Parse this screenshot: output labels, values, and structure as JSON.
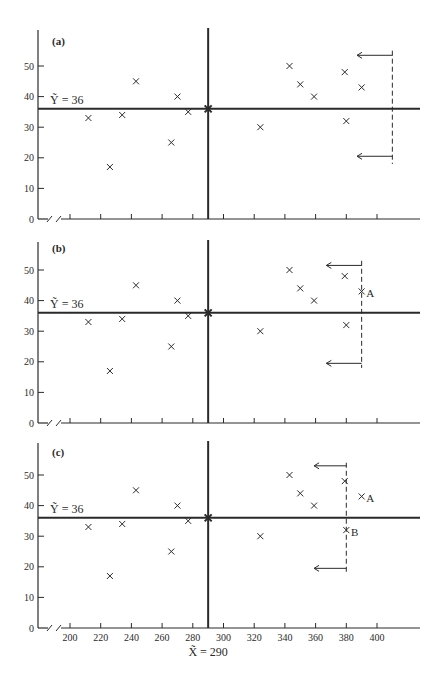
{
  "figure": {
    "ink_color": "#2a2a2a",
    "background": "#ffffff"
  },
  "chart_data": [
    {
      "type": "scatter",
      "panel_label": "(a)",
      "title": "",
      "xlabel": "",
      "ylabel": "",
      "xlim": [
        200,
        420
      ],
      "ylim": [
        0,
        58
      ],
      "yticks": [
        0,
        10,
        20,
        30,
        40,
        50
      ],
      "xticks": [
        200,
        220,
        240,
        260,
        280,
        300,
        320,
        340,
        360,
        380,
        400
      ],
      "show_xtick_labels": false,
      "axis_break": true,
      "grid": false,
      "median_x": 290,
      "median_y": 36,
      "median_y_label": "Ỹ = 36",
      "points": [
        {
          "x": 212,
          "y": 33
        },
        {
          "x": 226,
          "y": 17
        },
        {
          "x": 234,
          "y": 34
        },
        {
          "x": 243,
          "y": 45
        },
        {
          "x": 266,
          "y": 25
        },
        {
          "x": 270,
          "y": 40
        },
        {
          "x": 277,
          "y": 35
        },
        {
          "x": 290,
          "y": 36,
          "center": true
        },
        {
          "x": 324,
          "y": 30
        },
        {
          "x": 343,
          "y": 50
        },
        {
          "x": 350,
          "y": 44
        },
        {
          "x": 359,
          "y": 40
        },
        {
          "x": 379,
          "y": 48
        },
        {
          "x": 380,
          "y": 32
        },
        {
          "x": 390,
          "y": 43
        }
      ],
      "dashed_boundary": {
        "x": 410,
        "y_from": 18,
        "y_to": 55
      },
      "arrows": [
        {
          "y": 53.5,
          "from_x": 410,
          "to_x": 387
        },
        {
          "y": 20.5,
          "from_x": 410,
          "to_x": 387
        }
      ],
      "annotations": []
    },
    {
      "type": "scatter",
      "panel_label": "(b)",
      "title": "",
      "xlabel": "",
      "ylabel": "",
      "xlim": [
        200,
        420
      ],
      "ylim": [
        0,
        58
      ],
      "yticks": [
        0,
        10,
        20,
        30,
        40,
        50
      ],
      "xticks": [
        200,
        220,
        240,
        260,
        280,
        300,
        320,
        340,
        360,
        380,
        400
      ],
      "show_xtick_labels": false,
      "axis_break": true,
      "grid": false,
      "median_x": 290,
      "median_y": 36,
      "median_y_label": "Ỹ = 36",
      "points": [
        {
          "x": 212,
          "y": 33
        },
        {
          "x": 226,
          "y": 17
        },
        {
          "x": 234,
          "y": 34
        },
        {
          "x": 243,
          "y": 45
        },
        {
          "x": 266,
          "y": 25
        },
        {
          "x": 270,
          "y": 40
        },
        {
          "x": 277,
          "y": 35
        },
        {
          "x": 290,
          "y": 36,
          "center": true
        },
        {
          "x": 324,
          "y": 30
        },
        {
          "x": 343,
          "y": 50
        },
        {
          "x": 350,
          "y": 44
        },
        {
          "x": 359,
          "y": 40
        },
        {
          "x": 379,
          "y": 48
        },
        {
          "x": 380,
          "y": 32
        },
        {
          "x": 390,
          "y": 43
        }
      ],
      "dashed_boundary": {
        "x": 390,
        "y_from": 18,
        "y_to": 53
      },
      "arrows": [
        {
          "y": 51.5,
          "from_x": 390,
          "to_x": 367
        },
        {
          "y": 19.5,
          "from_x": 390,
          "to_x": 367
        }
      ],
      "annotations": [
        {
          "text": "A",
          "x": 393,
          "y": 42.5
        }
      ]
    },
    {
      "type": "scatter",
      "panel_label": "(c)",
      "title": "",
      "xlabel": "X̃ = 290",
      "ylabel": "",
      "xlim": [
        200,
        420
      ],
      "ylim": [
        0,
        58
      ],
      "yticks": [
        0,
        10,
        20,
        30,
        40,
        50
      ],
      "xticks": [
        200,
        220,
        240,
        260,
        280,
        300,
        320,
        340,
        360,
        380,
        400
      ],
      "show_xtick_labels": true,
      "axis_break": true,
      "grid": false,
      "median_x": 290,
      "median_y": 36,
      "median_y_label": "Ỹ = 36",
      "points": [
        {
          "x": 212,
          "y": 33
        },
        {
          "x": 226,
          "y": 17
        },
        {
          "x": 234,
          "y": 34
        },
        {
          "x": 243,
          "y": 45
        },
        {
          "x": 266,
          "y": 25
        },
        {
          "x": 270,
          "y": 40
        },
        {
          "x": 277,
          "y": 35
        },
        {
          "x": 290,
          "y": 36,
          "center": true
        },
        {
          "x": 324,
          "y": 30
        },
        {
          "x": 343,
          "y": 50
        },
        {
          "x": 350,
          "y": 44
        },
        {
          "x": 359,
          "y": 40
        },
        {
          "x": 379,
          "y": 48
        },
        {
          "x": 380,
          "y": 32
        },
        {
          "x": 390,
          "y": 43
        }
      ],
      "dashed_boundary": {
        "x": 380,
        "y_from": 18,
        "y_to": 54
      },
      "arrows": [
        {
          "y": 53,
          "from_x": 380,
          "to_x": 359
        },
        {
          "y": 19.5,
          "from_x": 380,
          "to_x": 359
        }
      ],
      "annotations": [
        {
          "text": "A",
          "x": 393,
          "y": 42.5
        },
        {
          "text": "B",
          "x": 383,
          "y": 31.5
        }
      ]
    }
  ]
}
